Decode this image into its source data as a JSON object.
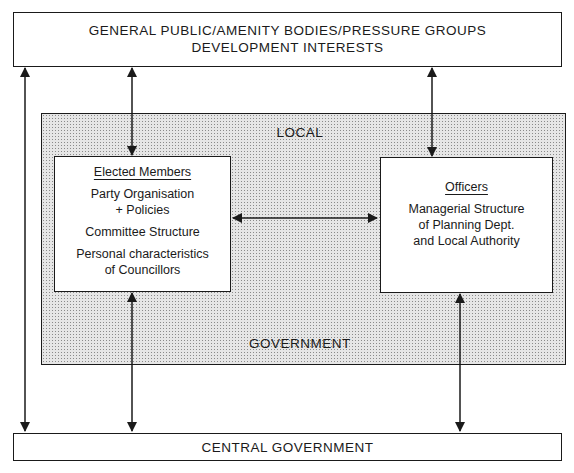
{
  "top_box": {
    "line1": "GENERAL PUBLIC/AMENITY BODIES/PRESSURE GROUPS",
    "line2": "DEVELOPMENT INTERESTS"
  },
  "local_government": {
    "label_top": "LOCAL",
    "label_bottom": "GOVERNMENT"
  },
  "elected_members": {
    "heading": "Elected Members",
    "items": [
      "Party Organisation\n+ Policies",
      "Committee Structure",
      "Personal characteristics\nof Councillors"
    ]
  },
  "officers": {
    "heading": "Officers",
    "items": [
      "Managerial Structure\nof Planning Dept.\nand Local Authority"
    ]
  },
  "bottom_box": {
    "label": "CENTRAL GOVERNMENT"
  },
  "connections": [
    {
      "from": "general_public",
      "to": "central_government",
      "type": "bidirectional"
    },
    {
      "from": "general_public",
      "to": "elected_members",
      "type": "bidirectional"
    },
    {
      "from": "general_public",
      "to": "officers",
      "type": "bidirectional"
    },
    {
      "from": "elected_members",
      "to": "officers",
      "type": "bidirectional"
    },
    {
      "from": "elected_members",
      "to": "central_government",
      "type": "bidirectional"
    },
    {
      "from": "officers",
      "to": "central_government",
      "type": "bidirectional"
    }
  ]
}
